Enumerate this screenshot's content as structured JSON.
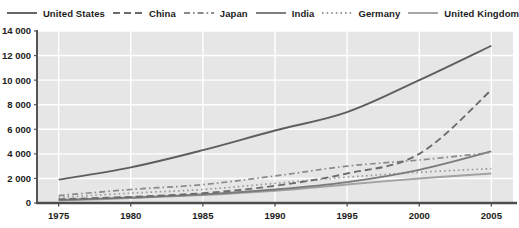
{
  "chart_data": {
    "type": "line",
    "title": "",
    "subtitle": "",
    "xlabel": "",
    "ylabel": "",
    "x": [
      1975,
      1980,
      1985,
      1990,
      1995,
      2000,
      2005
    ],
    "xlim": [
      1973.5,
      2006.5
    ],
    "ylim": [
      0,
      14000
    ],
    "xtick_labels": [
      "1975",
      "1980",
      "1985",
      "1990",
      "1995",
      "2000",
      "2005"
    ],
    "ytick_values": [
      0,
      2000,
      4000,
      6000,
      8000,
      10000,
      12000,
      14000
    ],
    "ytick_labels": [
      "0",
      "2 000",
      "4 000",
      "6 000",
      "8 000",
      "10 000",
      "12 000",
      "14 000"
    ],
    "grid": true,
    "grid_color": "#ffffff",
    "plot_background": "#e6e6e6",
    "axis_color": "#555555",
    "legend_position": "top",
    "series": [
      {
        "name": "United States",
        "style": "solid",
        "color": "#5e5e5e",
        "width": 1.9,
        "dash": "",
        "values": [
          1900,
          2900,
          4300,
          5900,
          7400,
          10000,
          12800
        ]
      },
      {
        "name": "China",
        "style": "long-dash",
        "color": "#6b6b6b",
        "width": 1.9,
        "dash": "7 4",
        "values": [
          300,
          500,
          800,
          1400,
          2400,
          4000,
          9200
        ]
      },
      {
        "name": "Japan",
        "style": "dash-dot",
        "color": "#8a8a8a",
        "width": 1.7,
        "dash": "6 3 1.6 3",
        "values": [
          600,
          1100,
          1500,
          2200,
          3000,
          3500,
          4100
        ]
      },
      {
        "name": "India",
        "style": "solid",
        "color": "#7a7a7a",
        "width": 1.9,
        "dash": "",
        "values": [
          250,
          450,
          700,
          1100,
          1700,
          2700,
          4200
        ]
      },
      {
        "name": "Germany",
        "style": "dotted",
        "color": "#9a9a9a",
        "width": 1.7,
        "dash": "1.6 3",
        "values": [
          450,
          800,
          1100,
          1600,
          2100,
          2500,
          2800
        ]
      },
      {
        "name": "United Kingdom",
        "style": "solid",
        "color": "#a2a2a2",
        "width": 1.9,
        "dash": "",
        "values": [
          200,
          400,
          650,
          1000,
          1500,
          2000,
          2400
        ]
      }
    ]
  },
  "legend": {
    "entries": [
      {
        "label": "United States",
        "style": "solid",
        "color": "#5e5e5e",
        "dash": ""
      },
      {
        "label": "China",
        "style": "long-dash",
        "color": "#6b6b6b",
        "dash": "7 4"
      },
      {
        "label": "Japan",
        "style": "dash-dot",
        "color": "#8a8a8a",
        "dash": "6 3 1.6 3"
      },
      {
        "label": "India",
        "style": "solid",
        "color": "#7a7a7a",
        "dash": ""
      },
      {
        "label": "Germany",
        "style": "dotted",
        "color": "#9a9a9a",
        "dash": "1.6 3"
      },
      {
        "label": "United Kingdom",
        "style": "solid",
        "color": "#a2a2a2",
        "dash": ""
      }
    ]
  }
}
